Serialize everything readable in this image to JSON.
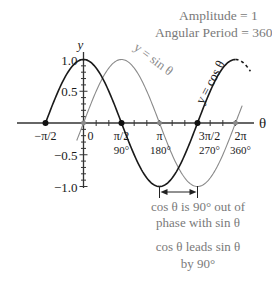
{
  "chart_data": {
    "type": "line",
    "title": "",
    "annotations": {
      "amplitude": "Amplitude = 1",
      "period": "Angular Period = 360°",
      "phase1": "cos θ is 90° out of",
      "phase2": "phase with sin θ",
      "lead1": "cos θ leads sin θ",
      "lead2": "by 90°"
    },
    "xlabel": "θ",
    "ylabel": "y",
    "xlim": [
      -1.8,
      7.0
    ],
    "ylim": [
      -1.0,
      1.0
    ],
    "x_ticks": [
      {
        "value": -1.5708,
        "label": "−π/2",
        "deg": ""
      },
      {
        "value": 0,
        "label": "0",
        "deg": ""
      },
      {
        "value": 1.5708,
        "label": "π/2",
        "deg": "90°"
      },
      {
        "value": 3.1416,
        "label": "π",
        "deg": "180°"
      },
      {
        "value": 4.7124,
        "label": "3π/2",
        "deg": "270°"
      },
      {
        "value": 6.2832,
        "label": "2π",
        "deg": "360°"
      }
    ],
    "y_ticks": [
      {
        "value": 1.0,
        "label": "1.0"
      },
      {
        "value": 0.5,
        "label": "0.5"
      },
      {
        "value": -0.5,
        "label": "−0.5"
      },
      {
        "value": -1.0,
        "label": "−1.0"
      }
    ],
    "series": [
      {
        "name": "y = cos θ",
        "color": "#1a1a1a",
        "x_range": [
          -1.5708,
          6.2832
        ],
        "dashed_extension": [
          6.2832,
          6.9
        ]
      },
      {
        "name": "y = sin θ",
        "color": "#8a8a8a",
        "x_range": [
          -0.28,
          6.56
        ]
      }
    ],
    "points": [
      {
        "x": -1.5708,
        "y": 0,
        "series": "cos"
      },
      {
        "x": 1.5708,
        "y": 0,
        "series": "cos"
      },
      {
        "x": 4.7124,
        "y": 0,
        "series": "cos"
      },
      {
        "x": 0,
        "y": 0,
        "series": "sin"
      },
      {
        "x": 3.1416,
        "y": 0,
        "series": "sin"
      },
      {
        "x": 6.2832,
        "y": 0,
        "series": "sin"
      }
    ],
    "phase_arrow": {
      "from": 3.1416,
      "to": 4.7124,
      "y": -1.2
    }
  }
}
